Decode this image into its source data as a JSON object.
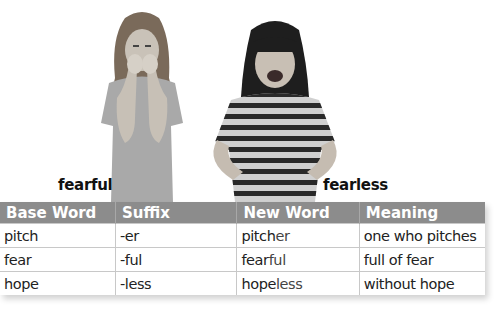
{
  "images": [
    {
      "name": "girl-fearful-photo",
      "caption": "fearful"
    },
    {
      "name": "girl-fearless-photo",
      "caption": "fearless"
    }
  ],
  "table": {
    "headers": [
      "Base Word",
      "Suffix",
      "New Word",
      "Meaning"
    ],
    "rows": [
      {
        "base": "pitch",
        "suffix": "-er",
        "new_base": "pitch",
        "new_suffix": "er",
        "meaning": "one who pitches"
      },
      {
        "base": "fear",
        "suffix": "-ful",
        "new_base": "fear",
        "new_suffix": "ful",
        "meaning": "full of fear"
      },
      {
        "base": "hope",
        "suffix": "-less",
        "new_base": "hope",
        "new_suffix": "less",
        "meaning": "without hope"
      }
    ]
  },
  "colors": {
    "header_bg": "#8c8c8c",
    "header_text": "#ffffff",
    "grid": "#c8c8c8"
  }
}
